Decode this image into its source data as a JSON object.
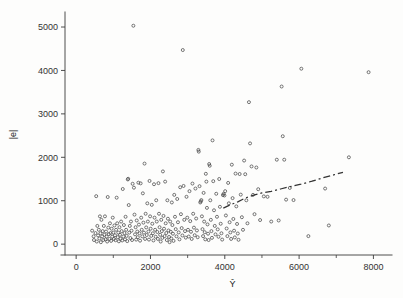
{
  "figure": {
    "background_color": "#fdfdfc",
    "ink_color": "#3a3a3a",
    "marker_color": "#4a4a4a",
    "trend_color": "#333333"
  },
  "chart_data": {
    "type": "scatter",
    "title": "",
    "subtitle": "",
    "xlabel": "Ŷ",
    "ylabel": "|e|",
    "xlim": [
      -300,
      8500
    ],
    "ylim": [
      -250,
      5300
    ],
    "grid": false,
    "legend": null,
    "x_major_ticks": [
      0,
      2000,
      4000,
      6000,
      8000
    ],
    "x_major_tick_labels": [
      "0",
      "2000",
      "4000",
      "6000",
      "8000"
    ],
    "x_minor_ticks": [
      1000,
      3000,
      5000,
      7000
    ],
    "y_major_ticks": [
      0,
      1000,
      2000,
      3000,
      4000,
      5000
    ],
    "y_major_tick_labels": [
      "0",
      "1000",
      "2000",
      "3000",
      "4000",
      "5000"
    ],
    "marker": "open-circle",
    "marker_size": 3,
    "series": [
      {
        "name": "absolute residuals",
        "points": [
          [
            430,
            310
          ],
          [
            470,
            180
          ],
          [
            480,
            95
          ],
          [
            520,
            255
          ],
          [
            540,
            1105
          ],
          [
            555,
            60
          ],
          [
            570,
            420
          ],
          [
            590,
            200
          ],
          [
            610,
            330
          ],
          [
            625,
            130
          ],
          [
            640,
            640
          ],
          [
            655,
            250
          ],
          [
            665,
            45
          ],
          [
            680,
            560
          ],
          [
            700,
            180
          ],
          [
            715,
            300
          ],
          [
            730,
            95
          ],
          [
            745,
            420
          ],
          [
            760,
            215
          ],
          [
            775,
            640
          ],
          [
            790,
            110
          ],
          [
            805,
            290
          ],
          [
            820,
            175
          ],
          [
            835,
            60
          ],
          [
            850,
            1085
          ],
          [
            865,
            380
          ],
          [
            880,
            230
          ],
          [
            895,
            120
          ],
          [
            910,
            480
          ],
          [
            925,
            255
          ],
          [
            940,
            75
          ],
          [
            955,
            355
          ],
          [
            970,
            170
          ],
          [
            985,
            610
          ],
          [
            1000,
            265
          ],
          [
            1015,
            120
          ],
          [
            1030,
            430
          ],
          [
            1045,
            205
          ],
          [
            1060,
            90
          ],
          [
            1075,
            330
          ],
          [
            1090,
            1070
          ],
          [
            1105,
            480
          ],
          [
            1120,
            160
          ],
          [
            1135,
            265
          ],
          [
            1150,
            65
          ],
          [
            1165,
            390
          ],
          [
            1180,
            215
          ],
          [
            1195,
            125
          ],
          [
            1210,
            520
          ],
          [
            1225,
            300
          ],
          [
            1240,
            85
          ],
          [
            1255,
            1270
          ],
          [
            1270,
            175
          ],
          [
            1285,
            440
          ],
          [
            1300,
            255
          ],
          [
            1315,
            110
          ],
          [
            1330,
            630
          ],
          [
            1345,
            330
          ],
          [
            1360,
            190
          ],
          [
            1375,
            70
          ],
          [
            1390,
            1490
          ],
          [
            1400,
            1505
          ],
          [
            1415,
            900
          ],
          [
            1430,
            265
          ],
          [
            1445,
            420
          ],
          [
            1460,
            140
          ],
          [
            1475,
            520
          ],
          [
            1490,
            310
          ],
          [
            1505,
            95
          ],
          [
            1520,
            1390
          ],
          [
            1540,
            5030
          ],
          [
            1555,
            1300
          ],
          [
            1570,
            680
          ],
          [
            1585,
            225
          ],
          [
            1600,
            390
          ],
          [
            1615,
            105
          ],
          [
            1630,
            545
          ],
          [
            1645,
            290
          ],
          [
            1660,
            160
          ],
          [
            1675,
            1415
          ],
          [
            1690,
            450
          ],
          [
            1705,
            250
          ],
          [
            1720,
            80
          ],
          [
            1735,
            1400
          ],
          [
            1750,
            610
          ],
          [
            1765,
            330
          ],
          [
            1780,
            180
          ],
          [
            1795,
            1170
          ],
          [
            1810,
            495
          ],
          [
            1825,
            265
          ],
          [
            1840,
            1855
          ],
          [
            1855,
            120
          ],
          [
            1870,
            700
          ],
          [
            1885,
            385
          ],
          [
            1900,
            210
          ],
          [
            1915,
            940
          ],
          [
            1930,
            520
          ],
          [
            1945,
            290
          ],
          [
            1960,
            105
          ],
          [
            1975,
            1455
          ],
          [
            1990,
            640
          ],
          [
            2005,
            355
          ],
          [
            2020,
            190
          ],
          [
            2035,
            905
          ],
          [
            2050,
            470
          ],
          [
            2065,
            250
          ],
          [
            2080,
            85
          ],
          [
            2095,
            1380
          ],
          [
            2110,
            610
          ],
          [
            2125,
            330
          ],
          [
            2140,
            170
          ],
          [
            2155,
            1010
          ],
          [
            2170,
            520
          ],
          [
            2185,
            280
          ],
          [
            2200,
            120
          ],
          [
            2215,
            1405
          ],
          [
            2230,
            700
          ],
          [
            2245,
            390
          ],
          [
            2260,
            215
          ],
          [
            2275,
            60
          ],
          [
            2290,
            560
          ],
          [
            2305,
            300
          ],
          [
            2320,
            145
          ],
          [
            2335,
            1675
          ],
          [
            2350,
            650
          ],
          [
            2365,
            355
          ],
          [
            2380,
            185
          ],
          [
            2395,
            1440
          ],
          [
            2410,
            480
          ],
          [
            2425,
            255
          ],
          [
            2440,
            95
          ],
          [
            2455,
            1010
          ],
          [
            2470,
            585
          ],
          [
            2485,
            315
          ],
          [
            2500,
            165
          ],
          [
            2515,
            45
          ],
          [
            2530,
            520
          ],
          [
            2545,
            285
          ],
          [
            2560,
            130
          ],
          [
            2575,
            960
          ],
          [
            2590,
            440
          ],
          [
            2605,
            240
          ],
          [
            2620,
            75
          ],
          [
            2640,
            1135
          ],
          [
            2660,
            630
          ],
          [
            2680,
            345
          ],
          [
            2700,
            180
          ],
          [
            2720,
            1040
          ],
          [
            2740,
            505
          ],
          [
            2760,
            270
          ],
          [
            2780,
            110
          ],
          [
            2800,
            1310
          ],
          [
            2820,
            690
          ],
          [
            2840,
            370
          ],
          [
            2860,
            200
          ],
          [
            2870,
            4470
          ],
          [
            2890,
            1340
          ],
          [
            2910,
            560
          ],
          [
            2930,
            300
          ],
          [
            2950,
            150
          ],
          [
            2970,
            1090
          ],
          [
            2990,
            610
          ],
          [
            3010,
            330
          ],
          [
            3030,
            175
          ],
          [
            3050,
            1220
          ],
          [
            3070,
            530
          ],
          [
            3090,
            285
          ],
          [
            3110,
            120
          ],
          [
            3130,
            1395
          ],
          [
            3150,
            700
          ],
          [
            3170,
            380
          ],
          [
            3190,
            205
          ],
          [
            3210,
            1280
          ],
          [
            3230,
            590
          ],
          [
            3250,
            315
          ],
          [
            3270,
            160
          ],
          [
            3290,
            2170
          ],
          [
            3300,
            2130
          ],
          [
            3320,
            1335
          ],
          [
            3340,
            960
          ],
          [
            3355,
            985
          ],
          [
            3370,
            1015
          ],
          [
            3385,
            640
          ],
          [
            3400,
            345
          ],
          [
            3415,
            185
          ],
          [
            3430,
            1180
          ],
          [
            3445,
            520
          ],
          [
            3460,
            275
          ],
          [
            3475,
            110
          ],
          [
            3490,
            1620
          ],
          [
            3505,
            1440
          ],
          [
            3520,
            835
          ],
          [
            3535,
            455
          ],
          [
            3550,
            240
          ],
          [
            3565,
            95
          ],
          [
            3580,
            1845
          ],
          [
            3595,
            1805
          ],
          [
            3610,
            1010
          ],
          [
            3625,
            560
          ],
          [
            3640,
            300
          ],
          [
            3655,
            145
          ],
          [
            3670,
            2390
          ],
          [
            3690,
            1450
          ],
          [
            3710,
            780
          ],
          [
            3730,
            420
          ],
          [
            3750,
            225
          ],
          [
            3770,
            1160
          ],
          [
            3790,
            630
          ],
          [
            3810,
            340
          ],
          [
            3830,
            170
          ],
          [
            3850,
            1500
          ],
          [
            3870,
            860
          ],
          [
            3890,
            470
          ],
          [
            3910,
            250
          ],
          [
            3930,
            105
          ],
          [
            3950,
            1130
          ],
          [
            3970,
            1160
          ],
          [
            3990,
            1120
          ],
          [
            4010,
            1220
          ],
          [
            4030,
            660
          ],
          [
            4050,
            360
          ],
          [
            4070,
            185
          ],
          [
            4090,
            1410
          ],
          [
            4110,
            940
          ],
          [
            4130,
            505
          ],
          [
            4150,
            270
          ],
          [
            4170,
            120
          ],
          [
            4190,
            1830
          ],
          [
            4210,
            1060
          ],
          [
            4230,
            580
          ],
          [
            4250,
            310
          ],
          [
            4270,
            155
          ],
          [
            4290,
            1625
          ],
          [
            4310,
            870
          ],
          [
            4330,
            465
          ],
          [
            4350,
            245
          ],
          [
            4370,
            100
          ],
          [
            4400,
            1615
          ],
          [
            4430,
            1140
          ],
          [
            4460,
            620
          ],
          [
            4490,
            330
          ],
          [
            4520,
            1925
          ],
          [
            4550,
            1610
          ],
          [
            4580,
            1010
          ],
          [
            4610,
            480
          ],
          [
            4650,
            3270
          ],
          [
            4680,
            2320
          ],
          [
            4720,
            1790
          ],
          [
            4760,
            1135
          ],
          [
            4800,
            690
          ],
          [
            4850,
            1765
          ],
          [
            4900,
            1265
          ],
          [
            4950,
            555
          ],
          [
            5050,
            1100
          ],
          [
            5150,
            1090
          ],
          [
            5250,
            520
          ],
          [
            5400,
            1945
          ],
          [
            5450,
            545
          ],
          [
            5530,
            3630
          ],
          [
            5560,
            2485
          ],
          [
            5600,
            1945
          ],
          [
            5650,
            1025
          ],
          [
            5750,
            1295
          ],
          [
            5850,
            1015
          ],
          [
            6060,
            4040
          ],
          [
            6250,
            185
          ],
          [
            6700,
            1280
          ],
          [
            6800,
            430
          ],
          [
            7340,
            2000
          ],
          [
            7870,
            3960
          ]
        ]
      }
    ],
    "trend_line": {
      "style": "dashed",
      "points": [
        [
          3960,
          830
        ],
        [
          4150,
          905
        ],
        [
          4350,
          975
        ],
        [
          4560,
          1065
        ],
        [
          4780,
          1130
        ],
        [
          5000,
          1180
        ],
        [
          5250,
          1215
        ],
        [
          5500,
          1270
        ],
        [
          5760,
          1325
        ],
        [
          6050,
          1380
        ],
        [
          6350,
          1450
        ],
        [
          6650,
          1530
        ],
        [
          6950,
          1600
        ],
        [
          7180,
          1655
        ]
      ]
    }
  }
}
